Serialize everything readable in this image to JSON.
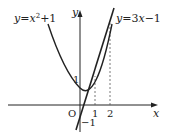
{
  "figure": {
    "curve_label": "y=x²+1",
    "curve_label_parts": {
      "y": "y",
      "eq": "=",
      "x": "x",
      "sup": "2",
      "rest": "+1"
    },
    "line_label_parts": {
      "y": "y",
      "eq": "=3",
      "x": "x",
      "rest": "−1"
    },
    "line_label": "y=3x−1",
    "x_axis_label": "x",
    "y_axis_label": "y",
    "origin_label": "O",
    "x_ticks": [
      "1",
      "2"
    ],
    "y_tick": "1",
    "y_intercept_label": "−1",
    "colors": {
      "stroke": "#222222",
      "dashed": "#555555",
      "background": "#ffffff"
    }
  }
}
